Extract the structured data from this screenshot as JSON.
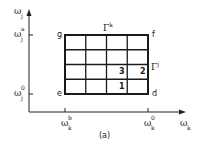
{
  "figure": {
    "caption": "(a)",
    "axes": {
      "x_label": {
        "base": "ω",
        "sub": "k"
      },
      "y_label": {
        "base": "ω",
        "sub": "j"
      },
      "x_ticks": [
        {
          "base": "ω",
          "sup": "b",
          "sub": "k"
        },
        {
          "base": "ω",
          "sup": "0",
          "sub": "k"
        }
      ],
      "y_ticks": [
        {
          "base": "ω",
          "sup": "a",
          "sub": "j"
        },
        {
          "base": "ω",
          "sup": "0",
          "sub": "j"
        }
      ]
    },
    "corners": {
      "top_left": "g",
      "top_right": "f",
      "bottom_left": "e",
      "bottom_right": "d"
    },
    "boundaries": {
      "top": {
        "base": "Γ",
        "sup": "k"
      },
      "right": {
        "base": "Γ",
        "sup": "j"
      }
    },
    "grid": {
      "columns": 4,
      "rows": 4
    },
    "cell_labels": [
      {
        "text": "3",
        "row": 2,
        "col": 2
      },
      {
        "text": "2",
        "row": 2,
        "col": 3
      },
      {
        "text": "1",
        "row": 3,
        "col": 2
      }
    ]
  }
}
